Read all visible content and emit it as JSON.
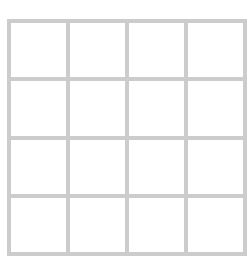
{
  "grid": {
    "rows": 4,
    "columns": 4,
    "line_color": "#cccccc",
    "cell_color": "#ffffff",
    "cells": [
      [
        "",
        "",
        "",
        ""
      ],
      [
        "",
        "",
        "",
        ""
      ],
      [
        "",
        "",
        "",
        ""
      ],
      [
        "",
        "",
        "",
        ""
      ]
    ]
  }
}
